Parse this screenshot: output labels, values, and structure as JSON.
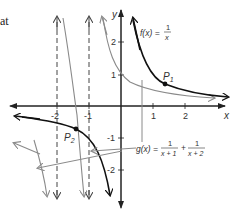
{
  "edge_text": "at",
  "axes": {
    "x_label": "x",
    "y_label": "y",
    "x_ticks": [
      "-2",
      "-1",
      "1",
      "2"
    ],
    "y_ticks": [
      "2",
      "1",
      "-1",
      "-2"
    ]
  },
  "functions": {
    "f": {
      "name": "f(x) =",
      "numerator": "1",
      "denominator": "x",
      "color": "#111111"
    },
    "g": {
      "name": "g(x) =",
      "term1_numerator": "1",
      "term1_denominator": "x + 1",
      "plus": "+",
      "term2_numerator": "1",
      "term2_denominator": "x + 2",
      "color": "#8a8a8a"
    }
  },
  "points": {
    "p1": {
      "label": "P",
      "subscript": "1"
    },
    "p2": {
      "label": "P",
      "subscript": "2"
    }
  },
  "asymptotes": {
    "vertical": [
      "x = -2",
      "x = -1"
    ],
    "style": "dashed"
  },
  "colors": {
    "axis": "#222222",
    "f_curve": "#111111",
    "g_curve": "#8a8a8a",
    "asymptote": "#444444"
  }
}
